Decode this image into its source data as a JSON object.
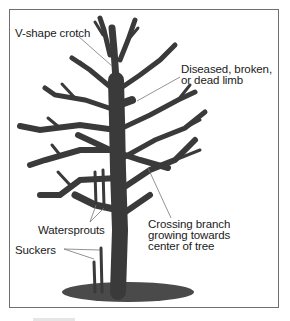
{
  "diagram": {
    "type": "labeled-illustration",
    "colors": {
      "branch": "#3a3a3a",
      "ground_shadow": "#4a4a4a",
      "leader_line": "#777777",
      "frame_border": "#6f6f6f",
      "text": "#1a1a1a"
    },
    "labels": [
      {
        "id": "v-shape-crotch",
        "text": "V-shape crotch"
      },
      {
        "id": "diseased-limb",
        "lines": [
          "Diseased, broken,",
          "or dead limb"
        ]
      },
      {
        "id": "waterspouts",
        "text": "Watersprouts"
      },
      {
        "id": "suckers",
        "text": "Suckers"
      },
      {
        "id": "crossing-branch",
        "lines": [
          "Crossing branch",
          "growing towards",
          "center of tree"
        ]
      }
    ]
  }
}
